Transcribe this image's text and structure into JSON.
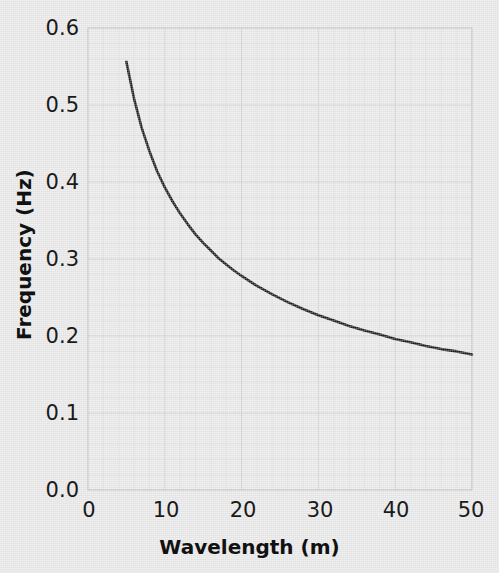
{
  "chart_data": {
    "type": "line",
    "title": "",
    "xlabel": "Wavelength (m)",
    "ylabel": "Frequency (Hz)",
    "xlim": [
      0,
      50
    ],
    "ylim": [
      0.0,
      0.6
    ],
    "xticks": [
      "0",
      "10",
      "20",
      "30",
      "40",
      "50"
    ],
    "xtick_values": [
      0,
      10,
      20,
      30,
      40,
      50
    ],
    "yticks": [
      "0.0",
      "0.1",
      "0.2",
      "0.3",
      "0.4",
      "0.5",
      "0.6"
    ],
    "ytick_values": [
      0.0,
      0.1,
      0.2,
      0.3,
      0.4,
      0.5,
      0.6
    ],
    "grid": true,
    "minor_grid": true,
    "legend": "none",
    "line_color": "#1a1a1a",
    "grid_color": "#d0d0d0",
    "background_color": "#e8e8e8",
    "series": [
      {
        "name": "deep-water dispersion",
        "x": [
          5,
          6,
          7,
          8,
          9,
          10,
          11,
          12,
          13,
          14,
          15,
          16,
          17,
          18,
          19,
          20,
          22,
          24,
          26,
          28,
          30,
          32,
          34,
          36,
          38,
          40,
          42,
          44,
          46,
          48,
          50
        ],
        "y": [
          0.556,
          0.508,
          0.47,
          0.44,
          0.414,
          0.393,
          0.375,
          0.359,
          0.345,
          0.332,
          0.321,
          0.311,
          0.301,
          0.293,
          0.285,
          0.278,
          0.265,
          0.254,
          0.244,
          0.235,
          0.227,
          0.22,
          0.213,
          0.207,
          0.202,
          0.196,
          0.192,
          0.187,
          0.183,
          0.18,
          0.176
        ]
      }
    ]
  },
  "axes": {
    "x_label_text": "Wavelength (m)",
    "y_label_text": "Frequency (Hz)"
  }
}
